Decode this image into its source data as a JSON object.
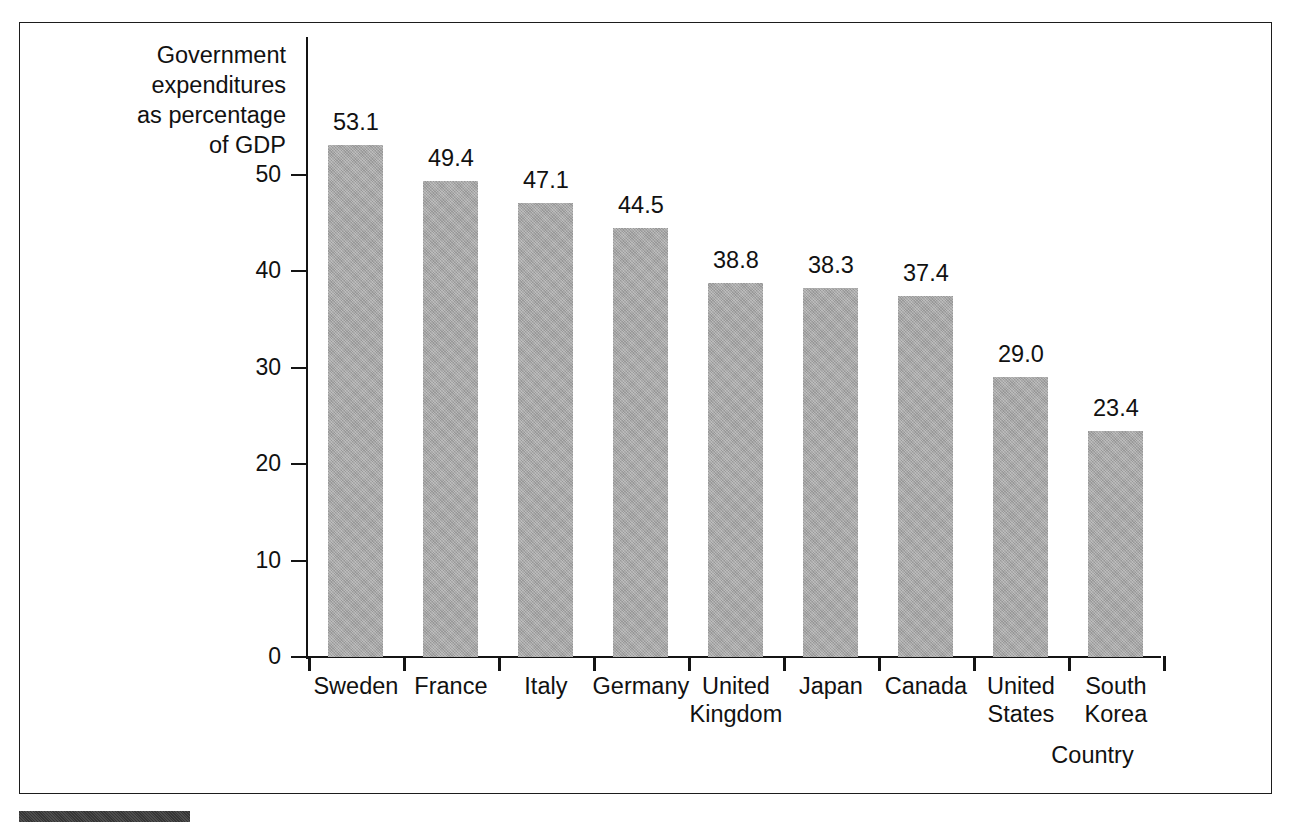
{
  "chart_data": {
    "type": "bar",
    "title": "",
    "xlabel": "Country",
    "ylabel": "Government\nexpenditures\nas percentage\nof GDP",
    "categories": [
      "Sweden",
      "France",
      "Italy",
      "Germany",
      "United\nKingdom",
      "Japan",
      "Canada",
      "United\nStates",
      "South\nKorea"
    ],
    "values": [
      53.1,
      49.4,
      47.1,
      44.5,
      38.8,
      38.3,
      37.4,
      29.0,
      23.4
    ],
    "value_labels": [
      "53.1",
      "49.4",
      "47.1",
      "44.5",
      "38.8",
      "38.3",
      "37.4",
      "29.0",
      "23.4"
    ],
    "ylim": [
      0,
      55
    ],
    "yticks": [
      0,
      10,
      20,
      30,
      40,
      50
    ],
    "ytick_labels": [
      "0",
      "10",
      "20",
      "30",
      "40",
      "50"
    ],
    "grid": false,
    "legend": null,
    "bar_color": "#a6a6a6",
    "axis_color": "#141414",
    "text_color": "#111111"
  },
  "figure": {
    "frame_color": "#1d1d1d",
    "background": "#ffffff",
    "bottom_accent_color": "#3c3c3c"
  }
}
